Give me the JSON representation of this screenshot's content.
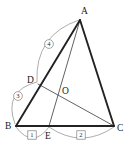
{
  "figure": {
    "kind": "plane-geometry-diagram",
    "title": "",
    "canvas": {
      "width": 128,
      "height": 147,
      "background": "#ffffff"
    },
    "colors": {
      "thick_stroke": "#222222",
      "thin_stroke": "#3a3a3a",
      "arc_stroke": "#8a8a8a",
      "label_text": "#1a1a1a",
      "badge_text": "#2b2b2b",
      "badge_stroke": "#7d7d7d",
      "badge_fill": "#ffffff"
    }
  },
  "points": [
    {
      "id": "A",
      "label": "A",
      "x": 80,
      "y": 20,
      "label_x": 81,
      "label_y": 14
    },
    {
      "id": "B",
      "label": "B",
      "x": 16,
      "y": 126,
      "label_x": 5,
      "label_y": 129
    },
    {
      "id": "C",
      "label": "C",
      "x": 114,
      "y": 126,
      "label_x": 117,
      "label_y": 131
    },
    {
      "id": "D",
      "label": "D",
      "x": 38,
      "y": 84,
      "label_x": 27,
      "label_y": 83
    },
    {
      "id": "E",
      "label": "E",
      "x": 49,
      "y": 126,
      "label_x": 45,
      "label_y": 139
    },
    {
      "id": "O",
      "label": "O",
      "x": 60,
      "y": 90,
      "label_x": 62,
      "label_y": 94
    }
  ],
  "segments": [
    {
      "id": "BA",
      "from": "B",
      "to": "A",
      "weight": "thick"
    },
    {
      "id": "AC",
      "from": "A",
      "to": "C",
      "weight": "thick"
    },
    {
      "id": "BC",
      "from": "B",
      "to": "C",
      "weight": "thick"
    },
    {
      "id": "AE",
      "from": "A",
      "to": "E",
      "weight": "thin"
    },
    {
      "id": "DC",
      "from": "D",
      "to": "C",
      "weight": "thin"
    }
  ],
  "ratio_arcs": [
    {
      "id": "arc-BE",
      "label": "1",
      "badge_shape": "box",
      "measures": "BE",
      "from": {
        "x": 16,
        "y": 127
      },
      "to": {
        "x": 49,
        "y": 127
      },
      "bulge": 11,
      "badge_x": 32,
      "badge_y": 135
    },
    {
      "id": "arc-EC",
      "label": "2",
      "badge_shape": "box",
      "measures": "EC",
      "from": {
        "x": 49,
        "y": 127
      },
      "to": {
        "x": 114,
        "y": 127
      },
      "bulge": 11,
      "badge_x": 81,
      "badge_y": 135
    },
    {
      "id": "arc-BD",
      "label": "3",
      "badge_shape": "circle",
      "measures": "BD",
      "from": {
        "x": 15,
        "y": 124
      },
      "to": {
        "x": 37,
        "y": 82
      },
      "bulge": -13,
      "badge_x": 18,
      "badge_y": 96
    },
    {
      "id": "arc-DA",
      "label": "4",
      "badge_shape": "circle",
      "measures": "DA",
      "from": {
        "x": 37,
        "y": 82
      },
      "to": {
        "x": 79,
        "y": 20
      },
      "bulge": -14,
      "badge_x": 49,
      "badge_y": 44
    }
  ]
}
